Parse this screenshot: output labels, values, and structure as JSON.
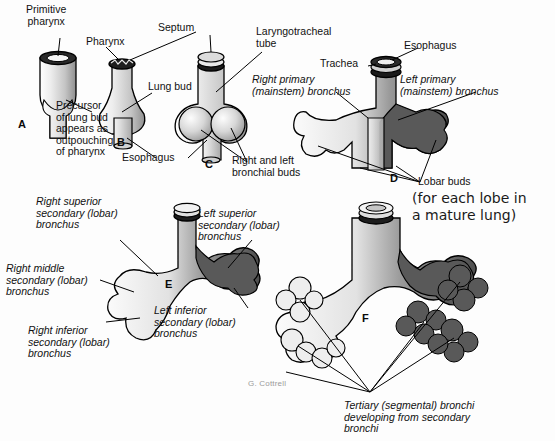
{
  "figure": {
    "signature": "G. Cottrell",
    "background_color": "#fdfdfd",
    "ink_color": "#111111",
    "light_tissue_color": "#d9d9d9",
    "dark_tissue_color": "#595959",
    "outline_color": "#000000"
  },
  "panels": [
    {
      "id": "A",
      "letter": "A",
      "labels": [
        {
          "key": "primitive_pharynx",
          "text": "Primitive\npharynx",
          "style": "plain"
        },
        {
          "key": "precursor",
          "text": "Precursor\nof lung bud\nappears as\noutpouching\nof pharynx",
          "style": "plain"
        }
      ]
    },
    {
      "id": "B",
      "letter": "B",
      "labels": [
        {
          "key": "pharynx",
          "text": "Pharynx",
          "style": "plain"
        },
        {
          "key": "lung_bud",
          "text": "Lung bud",
          "style": "plain"
        },
        {
          "key": "esophagus",
          "text": "Esophagus",
          "style": "plain"
        },
        {
          "key": "septum",
          "text": "Septum",
          "style": "plain"
        }
      ]
    },
    {
      "id": "C",
      "letter": "C",
      "labels": [
        {
          "key": "laryngotracheal_tube",
          "text": "Laryngotracheal\ntube",
          "style": "plain"
        },
        {
          "key": "bronchial_buds",
          "text": "Right and left\nbronchial buds",
          "style": "plain"
        }
      ]
    },
    {
      "id": "D",
      "letter": "D",
      "labels": [
        {
          "key": "trachea",
          "text": "Trachea",
          "style": "plain"
        },
        {
          "key": "esophagus_d",
          "text": "Esophagus",
          "style": "plain"
        },
        {
          "key": "right_primary",
          "text": "Right primary\n(mainstem) bronchus",
          "style": "italic"
        },
        {
          "key": "left_primary",
          "text": "Left primary\n(mainstem) bronchus",
          "style": "italic"
        },
        {
          "key": "lobar_buds",
          "text": "Lobar buds",
          "style": "plain"
        }
      ],
      "annotation": {
        "key": "lobar_note",
        "text": "(for each lobe in\na mature lung)",
        "style": "handwritten"
      }
    },
    {
      "id": "E",
      "letter": "E",
      "labels": [
        {
          "key": "right_superior",
          "text": "Right superior\nsecondary (lobar)\nbronchus",
          "style": "italic"
        },
        {
          "key": "right_middle",
          "text": "Right middle\nsecondary (lobar)\nbronchus",
          "style": "italic"
        },
        {
          "key": "right_inferior",
          "text": "Right inferior\nsecondary (lobar)\nbronchus",
          "style": "italic"
        },
        {
          "key": "left_superior",
          "text": "Left superior\nsecondary (lobar)\nbronchus",
          "style": "italic"
        },
        {
          "key": "left_inferior",
          "text": "Left inferior\nsecondary (lobar)\nbronchus",
          "style": "italic"
        }
      ]
    },
    {
      "id": "F",
      "letter": "F",
      "labels": [
        {
          "key": "tertiary",
          "text": "Tertiary (segmental) bronchi\ndeveloping from secondary\nbronchi",
          "style": "italic"
        }
      ]
    }
  ]
}
